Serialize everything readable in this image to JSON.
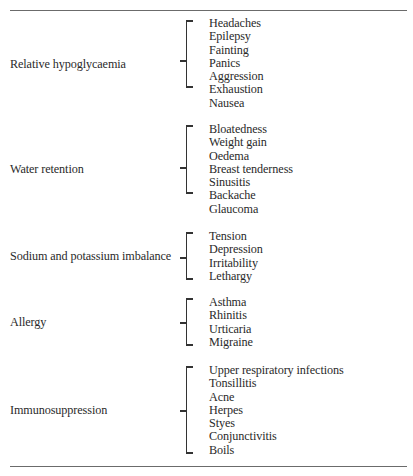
{
  "table": {
    "groups": [
      {
        "label": "Relative hypoglycaemia",
        "items": [
          "Headaches",
          "Epilepsy",
          "Fainting",
          "Panics",
          "Aggression",
          "Exhaustion",
          "Nausea"
        ]
      },
      {
        "label": "Water retention",
        "items": [
          "Bloatedness",
          "Weight gain",
          "Oedema",
          "Breast tenderness",
          "Sinusitis",
          "Backache",
          "Glaucoma"
        ]
      },
      {
        "label": "Sodium and potassium imbalance",
        "items": [
          "Tension",
          "Depression",
          "Irritability",
          "Lethargy"
        ]
      },
      {
        "label": "Allergy",
        "items": [
          "Asthma",
          "Rhinitis",
          "Urticaria",
          "Migraine"
        ]
      },
      {
        "label": "Immunosuppression",
        "items": [
          "Upper respiratory infections",
          "Tonsillitis",
          "Acne",
          "Herpes",
          "Styes",
          "Conjunctivitis",
          "Boils"
        ]
      }
    ]
  }
}
